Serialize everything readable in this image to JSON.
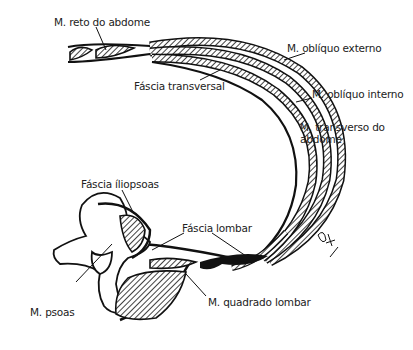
{
  "diagram": {
    "title": "",
    "labels": {
      "reto": "M. reto do abdome",
      "obliquo_externo": "M. oblíquo externo",
      "fascia_transversal": "Fáscia transversal",
      "obliquo_interno": "M. oblíquo interno",
      "transverso_line1": "M. transverso do",
      "transverso_line2": "abdome",
      "fascia_iliopsoas": "Fáscia íliopsoas",
      "fascia_lombar": "Fáscia lombar",
      "psoas": "M. psoas",
      "quadrado_lombar": "M. quadrado lombar"
    },
    "signature": "artist-signature",
    "colors": {
      "ink": "#111111",
      "background": "#ffffff"
    }
  }
}
